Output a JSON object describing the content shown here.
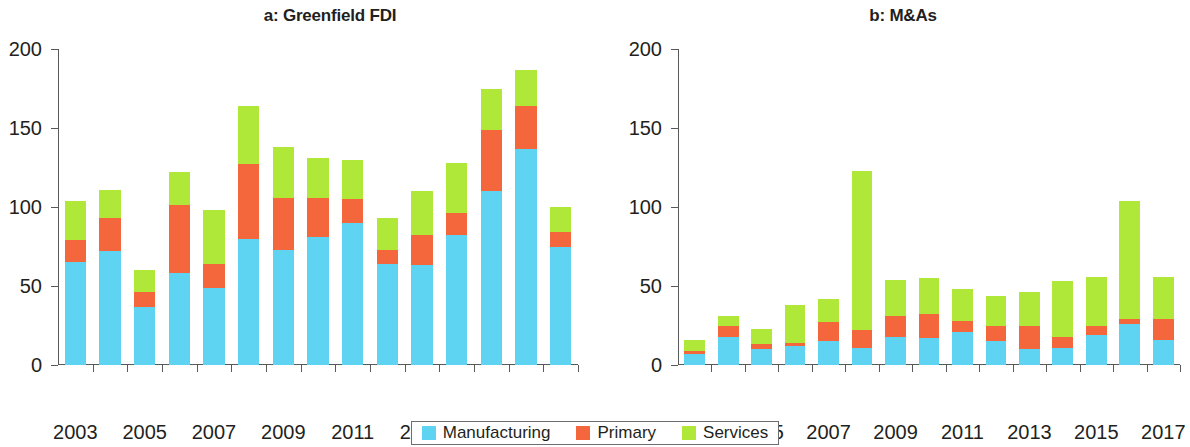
{
  "figure": {
    "panels": [
      {
        "id": "a",
        "title": "a: Greenfield FDI"
      },
      {
        "id": "b",
        "title": "b: M&As"
      }
    ]
  },
  "legend": {
    "items": [
      {
        "label": "Manufacturing",
        "color": "#5fd4f2",
        "swatch_name": "legend-swatch-manufacturing"
      },
      {
        "label": "Primary",
        "color": "#f4673c",
        "swatch_name": "legend-swatch-primary"
      },
      {
        "label": "Services",
        "color": "#b0e839",
        "swatch_name": "legend-swatch-services"
      }
    ]
  },
  "axis": {
    "y_ticks": [
      "0",
      "50",
      "100",
      "150",
      "200"
    ],
    "x_ticks_shown": [
      "2003",
      "2005",
      "2007",
      "2009",
      "2011",
      "2013",
      "2015",
      "2017"
    ]
  },
  "chart_data": [
    {
      "type": "bar",
      "title": "a: Greenfield FDI",
      "stacked": true,
      "xlabel": "",
      "ylabel": "",
      "ylim": [
        0,
        200
      ],
      "yticks": [
        0,
        50,
        100,
        150,
        200
      ],
      "grid": false,
      "legend_position": "bottom-center-shared",
      "categories": [
        "2003",
        "2004",
        "2005",
        "2006",
        "2007",
        "2008",
        "2009",
        "2010",
        "2011",
        "2012",
        "2013",
        "2014",
        "2015",
        "2016",
        "2017"
      ],
      "tick_labels_visible": [
        "2003",
        "",
        "2005",
        "",
        "2007",
        "",
        "2009",
        "",
        "2011",
        "",
        "2013",
        "",
        "2015",
        "",
        "2017"
      ],
      "series": [
        {
          "name": "Manufacturing",
          "color": "#5fd4f2",
          "values": [
            65,
            72,
            37,
            58,
            49,
            80,
            73,
            81,
            90,
            64,
            63,
            82,
            110,
            137,
            75
          ]
        },
        {
          "name": "Primary",
          "color": "#f4673c",
          "values": [
            14,
            21,
            9,
            43,
            15,
            47,
            33,
            25,
            15,
            9,
            19,
            14,
            39,
            27,
            9
          ]
        },
        {
          "name": "Services",
          "color": "#b0e839",
          "values": [
            25,
            18,
            14,
            21,
            34,
            37,
            32,
            25,
            25,
            20,
            28,
            32,
            26,
            23,
            16
          ]
        }
      ],
      "totals": [
        104,
        111,
        60,
        122,
        98,
        164,
        138,
        131,
        130,
        93,
        110,
        128,
        175,
        187,
        100
      ]
    },
    {
      "type": "bar",
      "title": "b: M&As",
      "stacked": true,
      "xlabel": "",
      "ylabel": "",
      "ylim": [
        0,
        200
      ],
      "yticks": [
        0,
        50,
        100,
        150,
        200
      ],
      "grid": false,
      "legend_position": "bottom-center-shared",
      "categories": [
        "2003",
        "2004",
        "2005",
        "2006",
        "2007",
        "2008",
        "2009",
        "2010",
        "2011",
        "2012",
        "2013",
        "2014",
        "2015",
        "2016",
        "2017"
      ],
      "tick_labels_visible": [
        "2003",
        "",
        "2005",
        "",
        "2007",
        "",
        "2009",
        "",
        "2011",
        "",
        "2013",
        "",
        "2015",
        "",
        "2017"
      ],
      "series": [
        {
          "name": "Manufacturing",
          "color": "#5fd4f2",
          "values": [
            7,
            18,
            10,
            12,
            15,
            11,
            18,
            17,
            21,
            15,
            10,
            11,
            19,
            26,
            16
          ]
        },
        {
          "name": "Primary",
          "color": "#f4673c",
          "values": [
            2,
            7,
            3,
            2,
            12,
            11,
            13,
            15,
            7,
            10,
            15,
            7,
            6,
            3,
            13
          ]
        },
        {
          "name": "Services",
          "color": "#b0e839",
          "values": [
            7,
            6,
            10,
            24,
            15,
            101,
            23,
            23,
            20,
            19,
            21,
            35,
            31,
            75,
            27
          ]
        }
      ],
      "totals": [
        16,
        31,
        23,
        38,
        42,
        123,
        54,
        55,
        48,
        44,
        46,
        53,
        56,
        104,
        56
      ]
    }
  ]
}
